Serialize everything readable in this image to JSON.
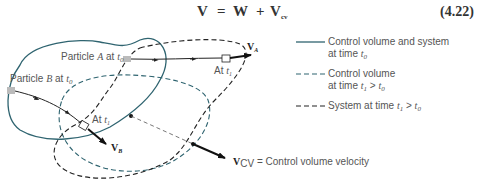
{
  "equation": {
    "lhs": "V",
    "eq": "=",
    "w": "W",
    "plus": "+",
    "vcv": "V",
    "vcv_sub": "cv",
    "number": "(4.22)"
  },
  "labels": {
    "particle_a": "Particle ",
    "particle_a_it": "A",
    "particle_a_at": " at ",
    "particle_a_t": "t",
    "particle_a_sub": "0",
    "particle_b": "Particle ",
    "particle_b_it": "B",
    "particle_b_at": " at ",
    "particle_b_t": "t",
    "particle_b_sub": "0",
    "at_t1_a": "At ",
    "at_t1_a_t": "t",
    "at_t1_a_sub": "1",
    "at_t1_b": "At ",
    "at_t1_b_t": "t",
    "at_t1_b_sub": "1",
    "va": "V",
    "va_sub": "A",
    "vb": "V",
    "vb_sub": "B",
    "vcv": "V",
    "vcv_sub": "CV",
    "vcv_desc": " = Control volume velocity"
  },
  "legend": [
    {
      "style": "solid",
      "line1": "Control volume and system",
      "line2": "at time ",
      "t": "t",
      "sub": "0",
      "suffix": ""
    },
    {
      "style": "dashed-blue",
      "line1": "Control volume",
      "line2": "at time ",
      "t": "t",
      "sub": "1",
      "suffix": " > ",
      "t2": "t",
      "sub2": "0"
    },
    {
      "style": "dashed-black",
      "line1": "System at time ",
      "t": "t",
      "sub": "1",
      "suffix": " > ",
      "t2": "t",
      "sub2": "0"
    }
  ],
  "colors": {
    "control_volume": "#2f6470",
    "system": "#222222",
    "particle": "#bbbbbb"
  }
}
